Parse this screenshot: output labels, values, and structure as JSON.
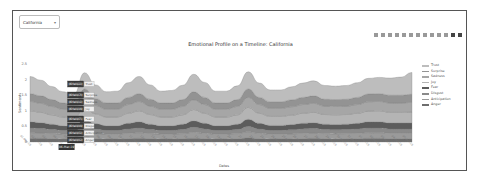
{
  "filter": {
    "selected": "California",
    "chevron": "chevron-down-icon"
  },
  "modebar": {
    "icons": [
      "camera-icon",
      "zoom-icon",
      "pan-icon",
      "box-select-icon",
      "lasso-icon",
      "zoom-in-icon",
      "zoom-out-icon",
      "autoscale-icon",
      "reset-axes-icon",
      "spike-lines-icon",
      "hover-closest-icon",
      "hover-compare-icon",
      "plotly-logo-icon"
    ]
  },
  "chart_data": {
    "type": "area",
    "title": "Emotional Profile on a Timeline: California",
    "xlabel": "Dates",
    "ylabel": "Sentiments",
    "ylim": [
      0,
      2.5
    ],
    "yticks": [
      "0",
      "0.5",
      "1",
      "1.5",
      "2",
      "2.5"
    ],
    "stacked": true,
    "legend_position": "right",
    "categories": [
      "01-Mar-19",
      "02-Mar-19",
      "03-Mar-19",
      "04-Mar-19",
      "05-Mar-19",
      "06-Mar-19",
      "07-Mar-19",
      "08-Mar-19",
      "09-Mar-19",
      "10-Mar-19",
      "11-Mar-19",
      "12-Mar-19",
      "13-Mar-19",
      "14-Mar-19",
      "15-Mar-19",
      "16-Mar-19",
      "17-Mar-19",
      "18-Mar-19",
      "19-Mar-19",
      "20-Mar-19",
      "21-Mar-19",
      "22-Mar-19",
      "23-Mar-19",
      "24-Mar-19",
      "25-Mar-19",
      "26-Mar-19",
      "27-Mar-19",
      "28-Mar-19",
      "29-Mar-19",
      "30-Mar-19",
      "31-Mar-19",
      "01-Apr-19",
      "02-Apr-19",
      "03-Apr-19",
      "04-Apr-19",
      "05-Apr-19"
    ],
    "series": [
      {
        "name": "Anger",
        "color": "#6e6e6e",
        "values": [
          0.12,
          0.12,
          0.11,
          0.1,
          0.09,
          0.12,
          0.11,
          0.1,
          0.1,
          0.11,
          0.12,
          0.11,
          0.1,
          0.1,
          0.11,
          0.12,
          0.11,
          0.1,
          0.1,
          0.11,
          0.13,
          0.11,
          0.1,
          0.1,
          0.1,
          0.11,
          0.12,
          0.11,
          0.1,
          0.11,
          0.11,
          0.12,
          0.12,
          0.11,
          0.11,
          0.11
        ]
      },
      {
        "name": "Anticipation",
        "color": "#9a9a9a",
        "values": [
          0.18,
          0.17,
          0.16,
          0.15,
          0.14,
          0.2,
          0.16,
          0.15,
          0.15,
          0.17,
          0.18,
          0.16,
          0.15,
          0.15,
          0.16,
          0.19,
          0.17,
          0.15,
          0.15,
          0.16,
          0.2,
          0.17,
          0.15,
          0.15,
          0.16,
          0.17,
          0.17,
          0.16,
          0.16,
          0.16,
          0.17,
          0.18,
          0.18,
          0.17,
          0.17,
          0.17
        ]
      },
      {
        "name": "Disgust",
        "color": "#8a8a8a",
        "values": [
          0.15,
          0.14,
          0.13,
          0.12,
          0.12,
          0.17,
          0.14,
          0.12,
          0.12,
          0.14,
          0.15,
          0.13,
          0.12,
          0.12,
          0.13,
          0.16,
          0.14,
          0.12,
          0.12,
          0.13,
          0.17,
          0.14,
          0.12,
          0.12,
          0.13,
          0.14,
          0.14,
          0.13,
          0.13,
          0.13,
          0.14,
          0.15,
          0.15,
          0.14,
          0.14,
          0.14
        ]
      },
      {
        "name": "Fear",
        "color": "#5c5c5c",
        "values": [
          0.2,
          0.19,
          0.17,
          0.15,
          0.14,
          0.22,
          0.18,
          0.15,
          0.15,
          0.18,
          0.2,
          0.17,
          0.15,
          0.15,
          0.17,
          0.21,
          0.18,
          0.15,
          0.15,
          0.17,
          0.23,
          0.18,
          0.16,
          0.16,
          0.17,
          0.18,
          0.19,
          0.17,
          0.17,
          0.17,
          0.18,
          0.2,
          0.2,
          0.19,
          0.19,
          0.19
        ]
      },
      {
        "name": "Joy",
        "color": "#b4b4b4",
        "values": [
          0.35,
          0.33,
          0.3,
          0.28,
          0.27,
          0.38,
          0.31,
          0.28,
          0.28,
          0.32,
          0.35,
          0.31,
          0.28,
          0.28,
          0.3,
          0.36,
          0.32,
          0.28,
          0.28,
          0.3,
          0.38,
          0.32,
          0.29,
          0.29,
          0.3,
          0.32,
          0.33,
          0.31,
          0.31,
          0.31,
          0.32,
          0.34,
          0.35,
          0.34,
          0.34,
          0.35
        ]
      },
      {
        "name": "Sadness",
        "color": "#a6a6a6",
        "values": [
          0.3,
          0.29,
          0.27,
          0.25,
          0.24,
          0.33,
          0.27,
          0.25,
          0.25,
          0.28,
          0.3,
          0.27,
          0.25,
          0.25,
          0.27,
          0.31,
          0.28,
          0.25,
          0.25,
          0.27,
          0.32,
          0.28,
          0.26,
          0.26,
          0.27,
          0.28,
          0.29,
          0.27,
          0.27,
          0.27,
          0.28,
          0.3,
          0.3,
          0.3,
          0.3,
          0.31
        ]
      },
      {
        "name": "Surprise",
        "color": "#939393",
        "values": [
          0.25,
          0.24,
          0.22,
          0.2,
          0.19,
          0.28,
          0.22,
          0.2,
          0.2,
          0.23,
          0.25,
          0.22,
          0.2,
          0.2,
          0.22,
          0.26,
          0.23,
          0.2,
          0.2,
          0.22,
          0.27,
          0.23,
          0.21,
          0.21,
          0.22,
          0.23,
          0.24,
          0.22,
          0.22,
          0.22,
          0.23,
          0.25,
          0.25,
          0.25,
          0.25,
          0.26
        ]
      },
      {
        "name": "Trust",
        "color": "#bdbdbd",
        "values": [
          0.55,
          0.5,
          0.42,
          0.36,
          0.33,
          0.52,
          0.44,
          0.36,
          0.38,
          0.47,
          0.55,
          0.46,
          0.38,
          0.4,
          0.46,
          0.56,
          0.48,
          0.38,
          0.38,
          0.44,
          0.55,
          0.46,
          0.38,
          0.38,
          0.42,
          0.46,
          0.48,
          0.44,
          0.43,
          0.44,
          0.47,
          0.5,
          0.52,
          0.55,
          0.58,
          0.7
        ]
      }
    ],
    "hover_labels": [
      "Trust",
      "Surprise",
      "Sadness",
      "Joy",
      "Fear",
      "Disgust",
      "Anticipation",
      "Anger"
    ],
    "hover_x_index": 5
  },
  "legend": {
    "items": [
      {
        "label": "Trust",
        "color": "#bdbdbd"
      },
      {
        "label": "Surprise",
        "color": "#939393"
      },
      {
        "label": "Sadness",
        "color": "#a6a6a6"
      },
      {
        "label": "Joy",
        "color": "#b4b4b4"
      },
      {
        "label": "Fear",
        "color": "#5c5c5c"
      },
      {
        "label": "Disgust",
        "color": "#8a8a8a"
      },
      {
        "label": "Anticipation",
        "color": "#9a9a9a"
      },
      {
        "label": "Anger",
        "color": "#6e6e6e"
      }
    ]
  }
}
